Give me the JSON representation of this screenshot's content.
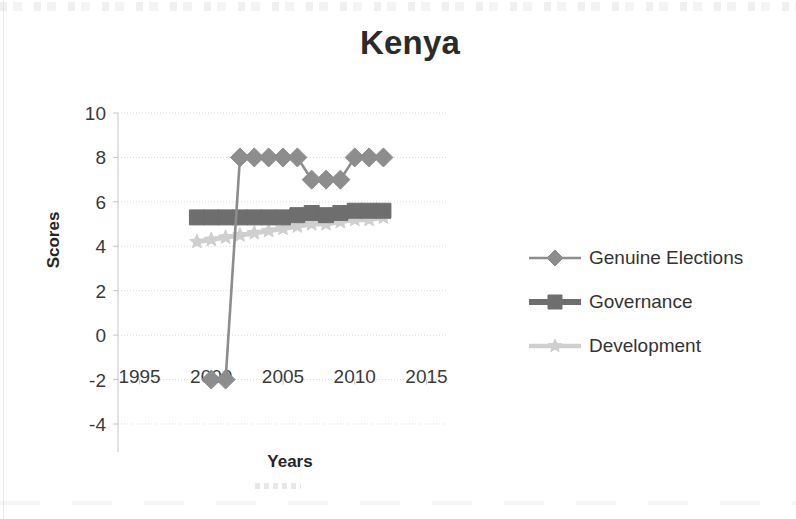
{
  "chart_data": {
    "type": "line",
    "title": "Kenya",
    "xlabel": "Years",
    "ylabel": "Scores",
    "xlim": [
      1993.5,
      2016.5
    ],
    "ylim": [
      -4,
      10
    ],
    "ytick_values": [
      10,
      8,
      6,
      4,
      2,
      0,
      -2,
      -4
    ],
    "ytick_labels": [
      "10",
      "8",
      "6",
      "4",
      "2",
      "0",
      "-2",
      "-4"
    ],
    "xtick_values": [
      1995,
      2000,
      2005,
      2010,
      2015
    ],
    "xtick_labels": [
      "1995",
      "2000",
      "2005",
      "2010",
      "2015"
    ],
    "grid": "horizontal",
    "legend_position": "right",
    "series": [
      {
        "name": "Genuine Elections",
        "marker": "diamond",
        "color": "#8d8d8d",
        "x": [
          2000,
          2001,
          2002,
          2003,
          2004,
          2005,
          2006,
          2007,
          2008,
          2009,
          2010,
          2011,
          2012
        ],
        "values": [
          -2,
          -2,
          8,
          8,
          8,
          8,
          8,
          7,
          7,
          7,
          8,
          8,
          8
        ]
      },
      {
        "name": "Governance",
        "marker": "square",
        "color": "#6e6e6e",
        "x": [
          1999,
          2000,
          2001,
          2002,
          2003,
          2004,
          2005,
          2006,
          2007,
          2008,
          2009,
          2010,
          2011,
          2012
        ],
        "values": [
          5.3,
          5.3,
          5.3,
          5.3,
          5.3,
          5.3,
          5.3,
          5.4,
          5.5,
          5.4,
          5.5,
          5.6,
          5.6,
          5.6
        ]
      },
      {
        "name": "Development",
        "marker": "star",
        "color": "#cfcfcf",
        "x": [
          1999,
          2000,
          2001,
          2002,
          2003,
          2004,
          2005,
          2006,
          2007,
          2008,
          2009,
          2010,
          2011,
          2012
        ],
        "values": [
          4.2,
          4.3,
          4.4,
          4.5,
          4.6,
          4.7,
          4.8,
          4.9,
          5.0,
          5.0,
          5.1,
          5.2,
          5.2,
          5.3
        ]
      }
    ]
  },
  "legend": {
    "items": [
      {
        "label": "Genuine Elections",
        "marker": "diamond",
        "color": "#8d8d8d"
      },
      {
        "label": "Governance",
        "marker": "square",
        "color": "#6e6e6e"
      },
      {
        "label": "Development",
        "marker": "star",
        "color": "#cfcfcf"
      }
    ]
  },
  "colors": {
    "gridline": "#d9d9d9",
    "axis": "#c6c6c6",
    "text": "#3a3a3a",
    "title": "#2b2b2b",
    "genuine_elections": "#8d8d8d",
    "governance": "#6e6e6e",
    "development": "#cfcfcf"
  }
}
